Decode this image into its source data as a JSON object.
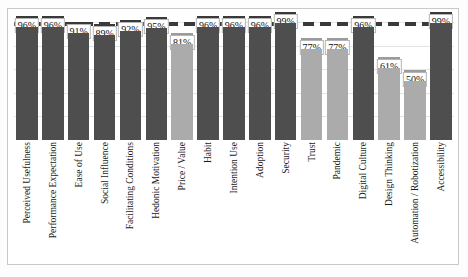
{
  "chart_data": {
    "type": "bar",
    "title": "",
    "xlabel": "",
    "ylabel": "",
    "ylim": [
      0,
      100
    ],
    "grid": true,
    "legend": "none",
    "reference_line": {
      "value": 100,
      "style": "dashed",
      "label": ""
    },
    "value_suffix": "%",
    "categories": [
      "Perceived Usefulness",
      "Performance Expectation",
      "Ease of Use",
      "Social Influence",
      "Facilitating Conditions",
      "Hedonic Motivation",
      "Price / Value",
      "Habit",
      "Intention Use",
      "Adoption",
      "Security",
      "Trust",
      "Pandemic",
      "Digital Culture",
      "Design Thinking",
      "Automation / Robotization",
      "Accessibility"
    ],
    "values": [
      96,
      96,
      91,
      89,
      92,
      95,
      81,
      96,
      96,
      96,
      99,
      77,
      77,
      96,
      61,
      50,
      99
    ],
    "labels": [
      "96%",
      "96%",
      "91%",
      "89%",
      "92%",
      "95%",
      "81%",
      "96%",
      "96%",
      "96%",
      "99%",
      "77%",
      "77%",
      "96%",
      "61%",
      "50%",
      "99%"
    ],
    "bar_shades": [
      "dark",
      "dark",
      "dark",
      "dark",
      "dark",
      "dark",
      "light",
      "dark",
      "dark",
      "dark",
      "dark",
      "light",
      "light",
      "dark",
      "light",
      "light",
      "dark"
    ],
    "colors": {
      "bar_dark": "#4e4e4e",
      "bar_light": "#ababab",
      "cap_dark": "#3a3a3a",
      "cap_light": "#9b9b9b",
      "grid": "#e4e4e4",
      "frame": "#c9c9c9",
      "background": "#ffffff",
      "label_box_border": "#b4b4b4",
      "text": "#1a1a1a"
    },
    "gridline_values": [
      20,
      40,
      60,
      80,
      100
    ]
  }
}
